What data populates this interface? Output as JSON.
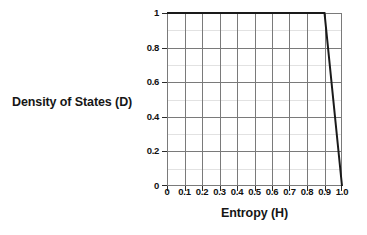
{
  "chart_data": {
    "type": "line",
    "title": "",
    "xlabel": "Entropy (H)",
    "ylabel": "Density of States (D)",
    "xlim": [
      0,
      1.0
    ],
    "ylim": [
      0,
      1.0
    ],
    "grid": true,
    "legend": "none",
    "x_tick_labels": [
      "0",
      "0.1",
      "0.2",
      "0.3",
      "0.4",
      "0.5",
      "0.6",
      "0.7",
      "0.8",
      "0.9",
      "1.0"
    ],
    "x_tick_values": [
      0,
      0.1,
      0.2,
      0.3,
      0.4,
      0.5,
      0.6,
      0.7,
      0.8,
      0.9,
      1.0
    ],
    "y_tick_labels": [
      "0",
      "0.2",
      "0.4",
      "0.6",
      "0.8",
      "1"
    ],
    "y_tick_values": [
      0,
      0.2,
      0.4,
      0.6,
      0.8,
      1.0
    ],
    "y_minor_gridline_values": [
      0.1,
      0.3,
      0.5,
      0.7,
      0.9
    ],
    "series": [
      {
        "name": "Density of States",
        "color": "#1a1a1a",
        "x": [
          0,
          0.9,
          1.0
        ],
        "values": [
          1.0,
          1.0,
          0.0
        ]
      }
    ]
  },
  "axes": {
    "x_title": "Entropy (H)",
    "y_title": "Density of States (D)"
  }
}
